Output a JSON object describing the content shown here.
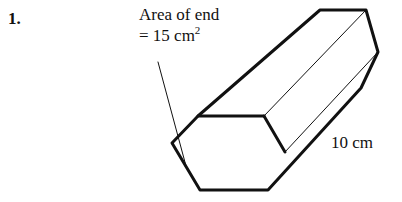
{
  "page": {
    "background_color": "#ffffff",
    "ink_color": "#111111",
    "width": 402,
    "height": 202
  },
  "question": {
    "number_label": "1."
  },
  "annotation": {
    "line1": "Area of end",
    "line2_prefix": "= 15 cm",
    "line2_exponent": "2",
    "leader_line": {
      "from_x": 158,
      "from_y": 62,
      "to_x": 186,
      "to_y": 166
    }
  },
  "dimension": {
    "length_label": "10 cm"
  },
  "figure": {
    "name": "hexagonal-prism",
    "stroke_color": "#111111",
    "outline_width": 3.0,
    "inner_edge_width": 1.0,
    "fill_color": "#ffffff",
    "front_face": {
      "name": "front-hexagon-end-face",
      "points": "198,116 264,116 285,152 268,190 200,190 172,143"
    },
    "back_face": {
      "name": "back-hexagon-end-face",
      "points": "320,10 366,10 378,52 361,88 316,88 304,46"
    },
    "top_body": {
      "name": "top-face",
      "points": "198,116 320,10 366,10 264,116"
    },
    "upper_right_body": {
      "name": "upper-right-face",
      "points": "264,116 366,10 378,52 285,152"
    },
    "lower_right_body": {
      "name": "lower-right-face",
      "points": "285,152 378,52 361,88 268,190"
    },
    "outline": {
      "name": "prism-silhouette",
      "points": "172,143 198,116 320,10 366,10 378,52 361,88 268,190 200,190"
    },
    "inner_edges": [
      {
        "name": "edge-front-top-left-to-back-top-left",
        "x1": 198,
        "y1": 116,
        "x2": 320,
        "y2": 10
      },
      {
        "name": "edge-front-top-right-to-back-top-right",
        "x1": 264,
        "y1": 116,
        "x2": 366,
        "y2": 10
      },
      {
        "name": "edge-front-right-to-back-right",
        "x1": 285,
        "y1": 152,
        "x2": 378,
        "y2": 52
      },
      {
        "name": "edge-front-top-edge",
        "x1": 198,
        "y1": 116,
        "x2": 264,
        "y2": 116
      },
      {
        "name": "edge-front-upper-right",
        "x1": 264,
        "y1": 116,
        "x2": 285,
        "y2": 152
      },
      {
        "name": "edge-front-bottom-right-to-back-bottom-right",
        "x1": 268,
        "y1": 190,
        "x2": 361,
        "y2": 88
      }
    ]
  }
}
